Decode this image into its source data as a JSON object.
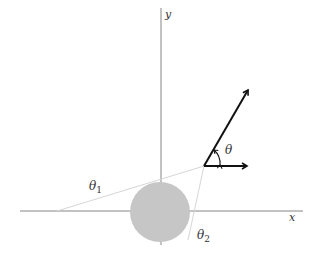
{
  "diagram": {
    "axes": {
      "x_label": "x",
      "y_label": "y"
    },
    "angle_labels": {
      "theta": "θ",
      "theta1": "θ",
      "theta1_sub": "1",
      "theta2": "θ",
      "theta2_sub": "2"
    },
    "colors": {
      "axis": "#555555",
      "circle_fill": "#c8c8c8",
      "vector": "#111111",
      "guide_line": "#d4d4d4"
    },
    "vector_angle_deg": 60
  }
}
